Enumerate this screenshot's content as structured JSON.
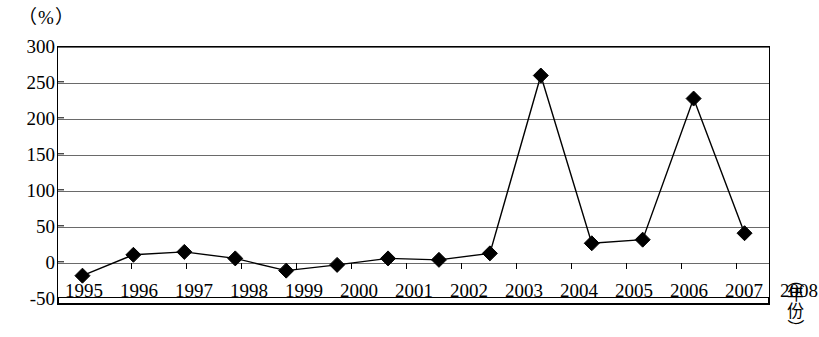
{
  "chart_data": {
    "type": "line",
    "title": "",
    "subtitle": "",
    "xlabel": "（年份）",
    "ylabel": "（%）",
    "categories": [
      "1995",
      "1996",
      "1997",
      "1998",
      "1999",
      "2000",
      "2001",
      "2002",
      "2003",
      "2004",
      "2005",
      "2006",
      "2007",
      "2008"
    ],
    "x": [
      1995,
      1996,
      1997,
      1998,
      1999,
      2000,
      2001,
      2002,
      2003,
      2004,
      2005,
      2006,
      2007,
      2008
    ],
    "values": [
      -19,
      10,
      14,
      5,
      -12,
      -4,
      5,
      3,
      12,
      259,
      26,
      31,
      227,
      40
    ],
    "series": [
      {
        "name": "",
        "values": [
          -19,
          10,
          14,
          5,
          -12,
          -4,
          5,
          3,
          12,
          259,
          26,
          31,
          227,
          40
        ],
        "marker": "diamond",
        "color": "#000000"
      }
    ],
    "ylim": [
      -50,
      300
    ],
    "ytick_values": [
      300,
      250,
      200,
      150,
      100,
      50,
      0,
      -50
    ],
    "ytick_labels": [
      "300",
      "250",
      "200",
      "150",
      "100",
      "50",
      "0",
      "-50"
    ],
    "grid": true,
    "grid_axis": "y",
    "legend": false,
    "legend_position": "none"
  },
  "axes": {
    "y_unit_label": "（%）",
    "x_title_chars": [
      "年",
      "份"
    ],
    "x_title_open_paren": "（",
    "x_title_close_paren": "）"
  }
}
